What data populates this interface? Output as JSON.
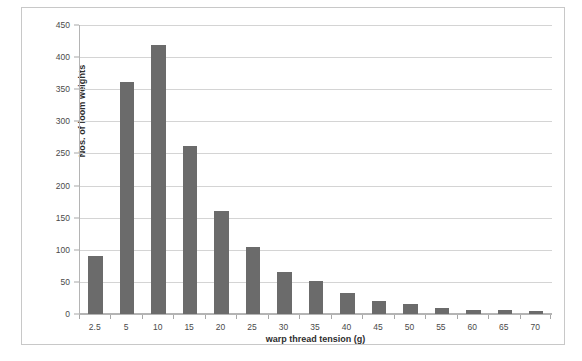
{
  "chart_data": {
    "type": "bar",
    "title": "",
    "xlabel": "warp thread tension (g)",
    "ylabel": "Nos. of loom weights",
    "categories": [
      "2.5",
      "5",
      "10",
      "15",
      "20",
      "25",
      "30",
      "35",
      "40",
      "45",
      "50",
      "55",
      "60",
      "65",
      "70"
    ],
    "values": [
      90,
      362,
      419,
      262,
      160,
      105,
      66,
      51,
      32,
      20,
      15,
      10,
      7,
      6,
      5
    ],
    "ylim": [
      0,
      450
    ],
    "ytick_values": [
      0,
      50,
      100,
      150,
      200,
      250,
      300,
      350,
      400,
      450
    ],
    "ytick_labels": [
      "0",
      "50",
      "100",
      "150",
      "200",
      "250",
      "300",
      "350",
      "400",
      "450"
    ],
    "grid": true,
    "legend": "none",
    "bar_color": "#6b6b6b",
    "grid_color": "#d4d4d4",
    "axis_color": "#b4b4b4",
    "plot_background": "#ffffff"
  }
}
